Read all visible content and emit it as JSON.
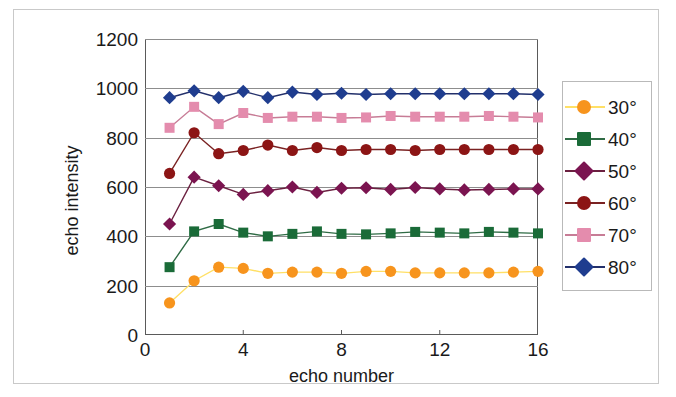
{
  "chart_data": {
    "type": "line",
    "title": "",
    "xlabel": "echo number",
    "ylabel": "echo intensity",
    "xlim": [
      0,
      16
    ],
    "ylim": [
      0,
      1200
    ],
    "xticks": [
      "0",
      "4",
      "8",
      "12",
      "16"
    ],
    "yticks": [
      "1200",
      "1000",
      "800",
      "600",
      "400",
      "200",
      "0"
    ],
    "grid": "horizontal",
    "legend_position": "right",
    "x": [
      1,
      2,
      3,
      4,
      5,
      6,
      7,
      8,
      9,
      10,
      11,
      12,
      13,
      14,
      15,
      16
    ],
    "series": [
      {
        "name": "30°",
        "color": "#F7941D",
        "line_color": "#FFE066",
        "marker": "circle",
        "values": [
          130,
          220,
          275,
          270,
          250,
          255,
          255,
          250,
          258,
          258,
          252,
          252,
          252,
          252,
          255,
          258
        ]
      },
      {
        "name": "40°",
        "color": "#1A6B38",
        "line_color": "#2F6B45",
        "marker": "square",
        "values": [
          275,
          420,
          450,
          415,
          400,
          410,
          420,
          410,
          408,
          412,
          418,
          415,
          412,
          418,
          415,
          412
        ]
      },
      {
        "name": "50°",
        "color": "#7B1450",
        "line_color": "#6B2040",
        "marker": "diamond",
        "values": [
          450,
          640,
          605,
          570,
          585,
          600,
          578,
          595,
          597,
          590,
          598,
          592,
          588,
          590,
          592,
          592
        ]
      },
      {
        "name": "60°",
        "color": "#8C1515",
        "line_color": "#7A2222",
        "marker": "circle",
        "values": [
          655,
          820,
          735,
          748,
          770,
          748,
          760,
          748,
          752,
          752,
          748,
          752,
          752,
          752,
          752,
          752
        ]
      },
      {
        "name": "70°",
        "color": "#E48CAD",
        "line_color": "#C77C96",
        "marker": "square",
        "values": [
          840,
          925,
          855,
          900,
          880,
          885,
          885,
          880,
          882,
          888,
          885,
          885,
          885,
          888,
          885,
          882
        ]
      },
      {
        "name": "80°",
        "color": "#1F3D8F",
        "line_color": "#23306B",
        "marker": "diamond",
        "values": [
          962,
          990,
          962,
          988,
          962,
          985,
          975,
          980,
          975,
          978,
          978,
          978,
          978,
          978,
          978,
          975
        ]
      }
    ]
  },
  "axes": {
    "ylabel_text": "echo intensity",
    "xlabel_text": "echo number"
  }
}
